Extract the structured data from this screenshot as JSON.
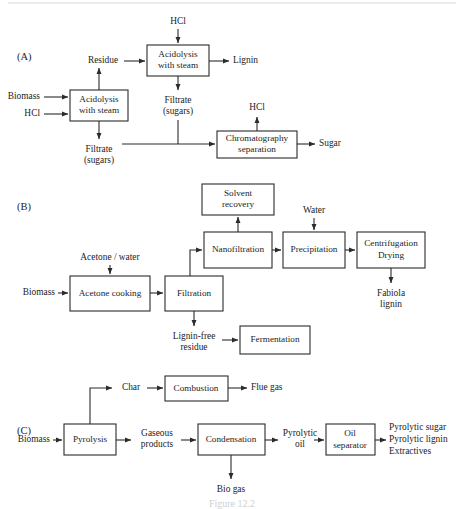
{
  "figure": {
    "caption": "Figure 12.2",
    "panels": [
      {
        "letter": "(A)",
        "name": "acid-hydrolysis-process",
        "nodes": [
          {
            "id": "a-acidolysis-1",
            "lines": [
              "Acidolysis",
              "with steam"
            ]
          },
          {
            "id": "a-acidolysis-2",
            "lines": [
              "Acidolysis",
              "with steam"
            ]
          },
          {
            "id": "a-chromatography",
            "lines": [
              "Chromatography",
              "separation"
            ]
          }
        ],
        "stream_labels": [
          {
            "id": "a-biomass",
            "text": "Biomass"
          },
          {
            "id": "a-hcl-in",
            "text": "HCl"
          },
          {
            "id": "a-hcl-top",
            "text": "HCl"
          },
          {
            "id": "a-residue",
            "text": "Residue"
          },
          {
            "id": "a-lignin",
            "text": "Lignin"
          },
          {
            "id": "a-filtrate-mid",
            "lines": [
              "Filtrate",
              "(sugars)"
            ]
          },
          {
            "id": "a-filtrate-low",
            "lines": [
              "Filtrate",
              "(sugars)"
            ]
          },
          {
            "id": "a-hcl-chrom",
            "text": "HCl"
          },
          {
            "id": "a-sugar",
            "text": "Sugar"
          }
        ]
      },
      {
        "letter": "(B)",
        "name": "organosolv-process",
        "nodes": [
          {
            "id": "b-solvent-recovery",
            "lines": [
              "Solvent",
              "recovery"
            ]
          },
          {
            "id": "b-nanofiltration",
            "lines": [
              "Nanofiltration"
            ]
          },
          {
            "id": "b-precipitation",
            "lines": [
              "Precipitation"
            ]
          },
          {
            "id": "b-centrifugation",
            "lines": [
              "Centrifugation",
              "Drying"
            ]
          },
          {
            "id": "b-acetone-cooking",
            "lines": [
              "Acetone cooking"
            ]
          },
          {
            "id": "b-filtration",
            "lines": [
              "Filtration"
            ]
          },
          {
            "id": "b-fermentation",
            "lines": [
              "Fermentation"
            ]
          }
        ],
        "stream_labels": [
          {
            "id": "b-biomass",
            "text": "Biomass"
          },
          {
            "id": "b-acetone-water",
            "text": "Acetone / water"
          },
          {
            "id": "b-water",
            "text": "Water"
          },
          {
            "id": "b-fabiola-lignin",
            "lines": [
              "Fabiola",
              "lignin"
            ]
          },
          {
            "id": "b-lignin-free-residue",
            "lines": [
              "Lignin-free",
              "residue"
            ]
          }
        ]
      },
      {
        "letter": "(C)",
        "name": "pyrolysis-process",
        "nodes": [
          {
            "id": "c-combustion",
            "lines": [
              "Combustion"
            ]
          },
          {
            "id": "c-pyrolysis",
            "lines": [
              "Pyrolysis"
            ]
          },
          {
            "id": "c-condensation",
            "lines": [
              "Condensation"
            ]
          },
          {
            "id": "c-oil-separator",
            "lines": [
              "Oil",
              "separator"
            ]
          }
        ],
        "stream_labels": [
          {
            "id": "c-biomass",
            "text": "Biomass"
          },
          {
            "id": "c-char",
            "text": "Char"
          },
          {
            "id": "c-flue-gas",
            "text": "Flue gas"
          },
          {
            "id": "c-gaseous-products",
            "lines": [
              "Gaseous",
              "products"
            ]
          },
          {
            "id": "c-bio-gas",
            "text": "Bio gas"
          },
          {
            "id": "c-pyrolytic-oil",
            "lines": [
              "Pyrolytic",
              "oil"
            ]
          },
          {
            "id": "c-products",
            "lines": [
              "Pyrolytic sugar",
              "Pyrolytic lignin",
              "Extractives"
            ]
          }
        ]
      }
    ]
  },
  "text": {
    "panelA_letter": "(A)",
    "panelB_letter": "(B)",
    "panelC_letter": "(C)",
    "a_acidolysis1_l1": "Acidolysis",
    "a_acidolysis1_l2": "with steam",
    "a_acidolysis2_l1": "Acidolysis",
    "a_acidolysis2_l2": "with steam",
    "a_chromatography_l1": "Chromatography",
    "a_chromatography_l2": "separation",
    "a_biomass": "Biomass",
    "a_hcl_in": "HCl",
    "a_hcl_top": "HCl",
    "a_residue": "Residue",
    "a_lignin": "Lignin",
    "a_filtrate_mid_l1": "Filtrate",
    "a_filtrate_mid_l2": "(sugars)",
    "a_filtrate_low_l1": "Filtrate",
    "a_filtrate_low_l2": "(sugars)",
    "a_hcl_chrom": "HCl",
    "a_sugar": "Sugar",
    "b_solvent_l1": "Solvent",
    "b_solvent_l2": "recovery",
    "b_nanofiltration": "Nanofiltration",
    "b_precipitation": "Precipitation",
    "b_centrifugation_l1": "Centrifugation",
    "b_centrifugation_l2": "Drying",
    "b_acetone_cooking": "Acetone cooking",
    "b_filtration": "Filtration",
    "b_fermentation": "Fermentation",
    "b_biomass": "Biomass",
    "b_acetone_water": "Acetone / water",
    "b_water": "Water",
    "b_fabiola_l1": "Fabiola",
    "b_fabiola_l2": "lignin",
    "b_ligninfree_l1": "Lignin-free",
    "b_ligninfree_l2": "residue",
    "c_combustion": "Combustion",
    "c_pyrolysis": "Pyrolysis",
    "c_condensation": "Condensation",
    "c_oilsep_l1": "Oil",
    "c_oilsep_l2": "separator",
    "c_biomass": "Biomass",
    "c_char": "Char",
    "c_flue_gas": "Flue gas",
    "c_gaseous_l1": "Gaseous",
    "c_gaseous_l2": "products",
    "c_bio_gas": "Bio gas",
    "c_pyroil_l1": "Pyrolytic",
    "c_pyroil_l2": "oil",
    "c_prod_l1": "Pyrolytic sugar",
    "c_prod_l2": "Pyrolytic lignin",
    "c_prod_l3": "Extractives",
    "caption": "Figure 12.2"
  },
  "colors": {
    "line": "#2b2b2b",
    "text": "#1d1d1d",
    "background": "#ffffff",
    "caption": "#cfcfcf"
  }
}
